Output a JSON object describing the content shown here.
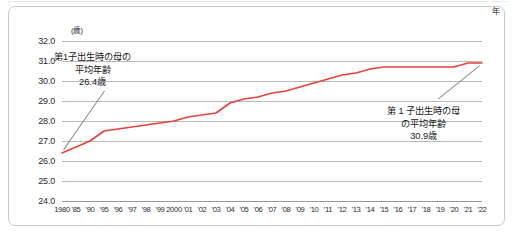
{
  "figure": {
    "y_unit_label": "(歳)",
    "x_unit_label": "年"
  },
  "annotations": {
    "left": {
      "line1": "第1子出生時の母の",
      "line2": "平均年齢",
      "line3": "26.4歳"
    },
    "right": {
      "line1": "第 1 子出生時の母",
      "line2": "の平均年齢",
      "line3": "30.9歳"
    }
  },
  "chart_data": {
    "type": "line",
    "title": "",
    "xlabel": "年",
    "ylabel": "(歳)",
    "ylim": [
      24.0,
      32.0
    ],
    "ytick_labels": [
      "32.0",
      "31.0",
      "30.0",
      "29.0",
      "28.0",
      "27.0",
      "26.0",
      "25.0",
      "24.0"
    ],
    "yticks": [
      32.0,
      31.0,
      30.0,
      29.0,
      28.0,
      27.0,
      26.0,
      25.0,
      24.0
    ],
    "grid": true,
    "legend": "none",
    "series_color": "#e8403a",
    "categories": [
      "1980",
      "'85",
      "'90",
      "'95",
      "'96",
      "'97",
      "'98",
      "'99",
      "2000",
      "'01",
      "'02",
      "'03",
      "'04",
      "'05",
      "'06",
      "'07",
      "'08",
      "'09",
      "'10",
      "'11",
      "'12",
      "'13",
      "'14",
      "'15",
      "'16",
      "'17",
      "'18",
      "'19",
      "'20",
      "'21",
      "'22"
    ],
    "series": [
      {
        "name": "第1子出生時の母の平均年齢",
        "values": [
          26.4,
          26.7,
          27.0,
          27.5,
          27.6,
          27.7,
          27.8,
          27.9,
          28.0,
          28.2,
          28.3,
          28.4,
          28.9,
          29.1,
          29.2,
          29.4,
          29.5,
          29.7,
          29.9,
          30.1,
          30.3,
          30.4,
          30.6,
          30.7,
          30.7,
          30.7,
          30.7,
          30.7,
          30.7,
          30.9,
          30.9
        ]
      }
    ],
    "annotation_points": [
      {
        "label": "26.4歳",
        "x": "1980",
        "y": 26.4
      },
      {
        "label": "30.9歳",
        "x": "'22",
        "y": 30.9
      }
    ]
  }
}
